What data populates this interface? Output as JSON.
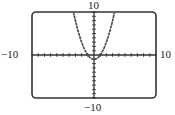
{
  "chart_data": {
    "type": "line",
    "title": "",
    "xlabel": "",
    "ylabel": "",
    "xlim": [
      -10,
      10
    ],
    "ylim": [
      -10,
      10
    ],
    "xscale": 1,
    "yscale": 1,
    "grid": false,
    "legend": null,
    "function": "y = x^2 - 1",
    "series": [
      {
        "name": "y = x^2 - 1",
        "x": [
          -3.32,
          -3,
          -2.5,
          -2,
          -1.5,
          -1,
          -0.5,
          0,
          0.5,
          1,
          1.5,
          2,
          2.5,
          3,
          3.32
        ],
        "y": [
          10,
          8,
          5.25,
          3,
          1.25,
          0,
          -0.75,
          -1,
          -0.75,
          0,
          1.25,
          3,
          5.25,
          8,
          10
        ]
      }
    ],
    "window_labels": {
      "xmin": "−10",
      "xmax": "10",
      "ymin": "−10",
      "ymax": "10"
    }
  },
  "colors": {
    "frame": "#333333",
    "axes": "#333333",
    "curve": "#444444",
    "background": "#ffffff"
  }
}
